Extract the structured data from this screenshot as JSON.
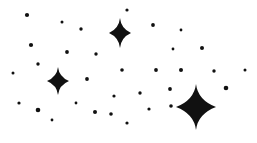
{
  "artwork": {
    "title": "Starry Night Sky Doodle",
    "description": "Hand-drawn ink illustration of a night sky with three four-pointed sparkle stars and many small round dots on a plain white background.",
    "medium": "ink-on-paper",
    "style": "monochrome-sketch"
  },
  "canvas": {
    "width": 257,
    "height": 143,
    "background_color": "#ffffff",
    "ink_color": "#111111"
  },
  "chart_data": {
    "type": "scatter",
    "title": "Starry Night Sky Doodle",
    "xlabel": "",
    "ylabel": "",
    "xlim": [
      0,
      257
    ],
    "ylim": [
      0,
      143
    ],
    "grid": false,
    "legend": "none",
    "series": [
      {
        "name": "sparkle-stars",
        "marker": "four-pointed-star",
        "points": [
          {
            "x": 120,
            "y": 33,
            "rx": 11,
            "ry": 15,
            "label": "star-upper-center"
          },
          {
            "x": 58,
            "y": 81,
            "rx": 11,
            "ry": 14,
            "label": "star-mid-left"
          },
          {
            "x": 196,
            "y": 107,
            "rx": 20,
            "ry": 23,
            "label": "star-lower-right"
          }
        ]
      },
      {
        "name": "small-dots",
        "marker": "circle",
        "points": [
          {
            "x": 27,
            "y": 15,
            "r": 2.1
          },
          {
            "x": 62,
            "y": 22,
            "r": 1.5
          },
          {
            "x": 81,
            "y": 29,
            "r": 1.7
          },
          {
            "x": 127,
            "y": 10,
            "r": 1.6
          },
          {
            "x": 153,
            "y": 25,
            "r": 1.9
          },
          {
            "x": 181,
            "y": 30,
            "r": 1.4
          },
          {
            "x": 31,
            "y": 45,
            "r": 2.1
          },
          {
            "x": 67,
            "y": 52,
            "r": 1.9
          },
          {
            "x": 96,
            "y": 54,
            "r": 1.7
          },
          {
            "x": 173,
            "y": 49,
            "r": 1.4
          },
          {
            "x": 202,
            "y": 48,
            "r": 2.0
          },
          {
            "x": 38,
            "y": 64,
            "r": 1.7
          },
          {
            "x": 13,
            "y": 73,
            "r": 1.5
          },
          {
            "x": 122,
            "y": 70,
            "r": 1.8
          },
          {
            "x": 156,
            "y": 70,
            "r": 1.9
          },
          {
            "x": 181,
            "y": 70,
            "r": 2.0
          },
          {
            "x": 214,
            "y": 71,
            "r": 1.7
          },
          {
            "x": 245,
            "y": 70,
            "r": 1.5
          },
          {
            "x": 87,
            "y": 79,
            "r": 1.9
          },
          {
            "x": 114,
            "y": 96,
            "r": 1.6
          },
          {
            "x": 140,
            "y": 93,
            "r": 1.7
          },
          {
            "x": 170,
            "y": 89,
            "r": 1.9
          },
          {
            "x": 226,
            "y": 88,
            "r": 2.3
          },
          {
            "x": 19,
            "y": 103,
            "r": 1.6
          },
          {
            "x": 38,
            "y": 110,
            "r": 2.3
          },
          {
            "x": 76,
            "y": 103,
            "r": 1.4
          },
          {
            "x": 149,
            "y": 109,
            "r": 1.6
          },
          {
            "x": 171,
            "y": 106,
            "r": 1.8
          },
          {
            "x": 52,
            "y": 120,
            "r": 1.4
          },
          {
            "x": 95,
            "y": 112,
            "r": 2.0
          },
          {
            "x": 111,
            "y": 114,
            "r": 1.8
          },
          {
            "x": 127,
            "y": 123,
            "r": 1.6
          }
        ]
      }
    ]
  }
}
